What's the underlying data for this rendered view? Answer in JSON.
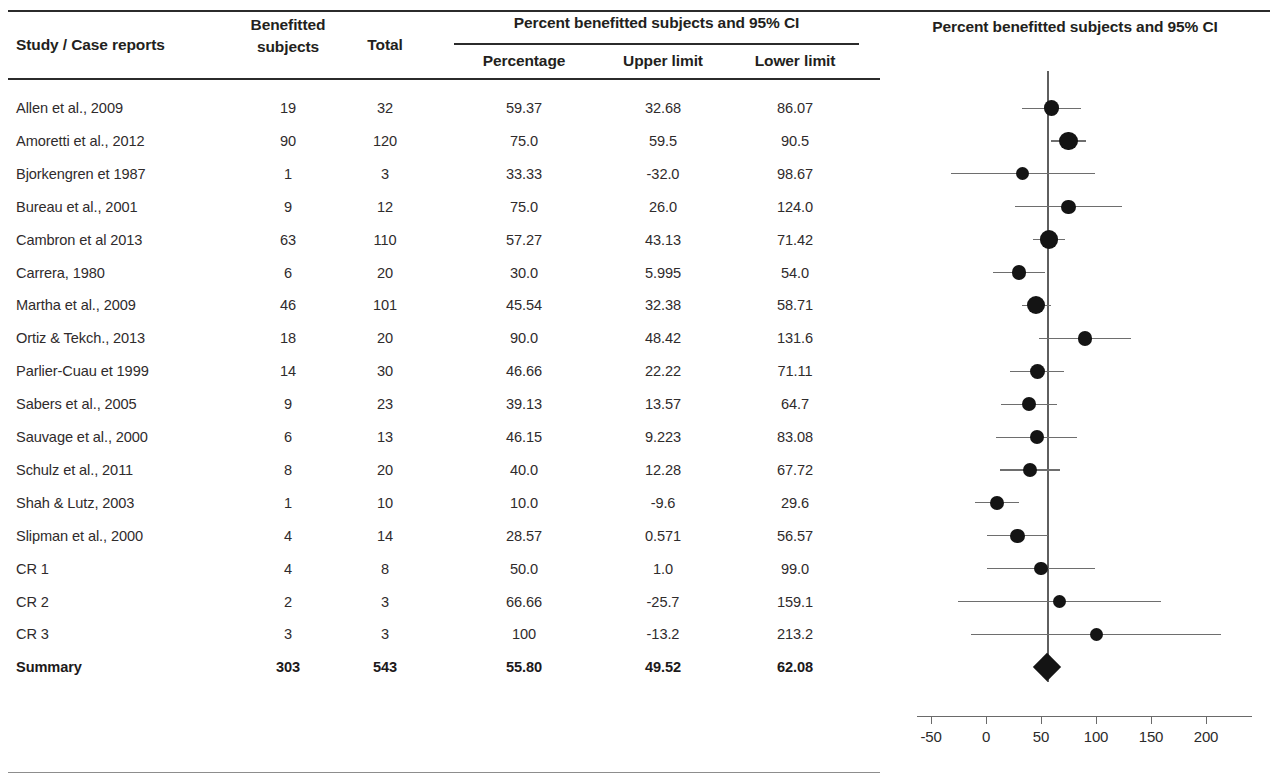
{
  "table": {
    "headers": {
      "study": "Study / Case reports",
      "benefitted_subjects": "Benefitted subjects",
      "total": "Total",
      "group_span": "Percent benefitted subjects and 95% CI",
      "percentage": "Percentage",
      "upper_limit": "Upper limit",
      "lower_limit": "Lower limit"
    },
    "rows": [
      {
        "study": "Allen et al., 2009",
        "benefitted": "19",
        "total": "32",
        "percentage": "59.37",
        "upper": "32.68",
        "lower": "86.07"
      },
      {
        "study": "Amoretti et al., 2012",
        "benefitted": "90",
        "total": "120",
        "percentage": "75.0",
        "upper": "59.5",
        "lower": "90.5"
      },
      {
        "study": "Bjorkengren et 1987",
        "benefitted": "1",
        "total": "3",
        "percentage": "33.33",
        "upper": "-32.0",
        "lower": "98.67"
      },
      {
        "study": "Bureau et al., 2001",
        "benefitted": "9",
        "total": "12",
        "percentage": "75.0",
        "upper": "26.0",
        "lower": "124.0"
      },
      {
        "study": "Cambron et al 2013",
        "benefitted": "63",
        "total": "110",
        "percentage": "57.27",
        "upper": "43.13",
        "lower": "71.42"
      },
      {
        "study": "Carrera, 1980",
        "benefitted": "6",
        "total": "20",
        "percentage": "30.0",
        "upper": "5.995",
        "lower": "54.0"
      },
      {
        "study": "Martha et al., 2009",
        "benefitted": "46",
        "total": "101",
        "percentage": "45.54",
        "upper": "32.38",
        "lower": "58.71"
      },
      {
        "study": "Ortiz & Tekch., 2013",
        "benefitted": "18",
        "total": "20",
        "percentage": "90.0",
        "upper": "48.42",
        "lower": "131.6"
      },
      {
        "study": "Parlier-Cuau et 1999",
        "benefitted": "14",
        "total": "30",
        "percentage": "46.66",
        "upper": "22.22",
        "lower": "71.11"
      },
      {
        "study": "Sabers et al., 2005",
        "benefitted": "9",
        "total": "23",
        "percentage": "39.13",
        "upper": "13.57",
        "lower": "64.7"
      },
      {
        "study": "Sauvage et al., 2000",
        "benefitted": "6",
        "total": "13",
        "percentage": "46.15",
        "upper": "9.223",
        "lower": "83.08"
      },
      {
        "study": "Schulz et al., 2011",
        "benefitted": "8",
        "total": "20",
        "percentage": "40.0",
        "upper": "12.28",
        "lower": "67.72"
      },
      {
        "study": "Shah & Lutz, 2003",
        "benefitted": "1",
        "total": "10",
        "percentage": "10.0",
        "upper": "-9.6",
        "lower": "29.6"
      },
      {
        "study": "Slipman et al., 2000",
        "benefitted": "4",
        "total": "14",
        "percentage": "28.57",
        "upper": "0.571",
        "lower": "56.57"
      },
      {
        "study": "CR 1",
        "benefitted": "4",
        "total": "8",
        "percentage": "50.0",
        "upper": "1.0",
        "lower": "99.0"
      },
      {
        "study": "CR 2",
        "benefitted": "2",
        "total": "3",
        "percentage": "66.66",
        "upper": "-25.7",
        "lower": "159.1"
      },
      {
        "study": "CR 3",
        "benefitted": "3",
        "total": "3",
        "percentage": "100",
        "upper": "-13.2",
        "lower": "213.2"
      },
      {
        "study": "Summary",
        "benefitted": "303",
        "total": "543",
        "percentage": "55.80",
        "upper": "49.52",
        "lower": "62.08"
      }
    ]
  },
  "chart_data": {
    "type": "forest",
    "title": "Percent benefitted subjects and 95% CI",
    "xlabel": "",
    "ylabel": "",
    "xlim": [
      -75,
      225
    ],
    "ticks": [
      -50,
      0,
      50,
      100,
      150,
      200
    ],
    "tick_labels": [
      "-50",
      "0",
      "50",
      "100",
      "150",
      "200"
    ],
    "grid": false,
    "reference_line": 55.8,
    "marker_color": "#141414",
    "line_color": "#6e6e6e",
    "points": [
      {
        "label": "Allen et al., 2009",
        "value": 59.37,
        "ci_low": 32.68,
        "ci_high": 86.07,
        "weight": 32
      },
      {
        "label": "Amoretti et al., 2012",
        "value": 75.0,
        "ci_low": 59.5,
        "ci_high": 90.5,
        "weight": 120
      },
      {
        "label": "Bjorkengren et 1987",
        "value": 33.33,
        "ci_low": -32.0,
        "ci_high": 98.67,
        "weight": 3
      },
      {
        "label": "Bureau et al., 2001",
        "value": 75.0,
        "ci_low": 26.0,
        "ci_high": 124.0,
        "weight": 12
      },
      {
        "label": "Cambron et al 2013",
        "value": 57.27,
        "ci_low": 43.13,
        "ci_high": 71.42,
        "weight": 110
      },
      {
        "label": "Carrera, 1980",
        "value": 30.0,
        "ci_low": 5.995,
        "ci_high": 54.0,
        "weight": 20
      },
      {
        "label": "Martha et al., 2009",
        "value": 45.54,
        "ci_low": 32.38,
        "ci_high": 58.71,
        "weight": 101
      },
      {
        "label": "Ortiz & Tekch., 2013",
        "value": 90.0,
        "ci_low": 48.42,
        "ci_high": 131.6,
        "weight": 20
      },
      {
        "label": "Parlier-Cuau et 1999",
        "value": 46.66,
        "ci_low": 22.22,
        "ci_high": 71.11,
        "weight": 30
      },
      {
        "label": "Sabers et al., 2005",
        "value": 39.13,
        "ci_low": 13.57,
        "ci_high": 64.7,
        "weight": 23
      },
      {
        "label": "Sauvage et al., 2000",
        "value": 46.15,
        "ci_low": 9.223,
        "ci_high": 83.08,
        "weight": 13
      },
      {
        "label": "Schulz et al., 2011",
        "value": 40.0,
        "ci_low": 12.28,
        "ci_high": 67.72,
        "weight": 20
      },
      {
        "label": "Shah & Lutz, 2003",
        "value": 10.0,
        "ci_low": -9.6,
        "ci_high": 29.6,
        "weight": 10
      },
      {
        "label": "Slipman et al., 2000",
        "value": 28.57,
        "ci_low": 0.571,
        "ci_high": 56.57,
        "weight": 14
      },
      {
        "label": "CR 1",
        "value": 50.0,
        "ci_low": 1.0,
        "ci_high": 99.0,
        "weight": 8
      },
      {
        "label": "CR 2",
        "value": 66.66,
        "ci_low": -25.7,
        "ci_high": 159.1,
        "weight": 3
      },
      {
        "label": "CR 3",
        "value": 100,
        "ci_low": -13.2,
        "ci_high": 213.2,
        "weight": 3
      },
      {
        "label": "Summary",
        "value": 55.8,
        "ci_low": 49.52,
        "ci_high": 62.08,
        "weight": 543,
        "summary": true
      }
    ]
  }
}
